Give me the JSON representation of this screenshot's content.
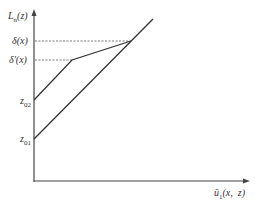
{
  "diagram": {
    "y_axis_label": "L",
    "y_axis_label_sub": "n",
    "y_axis_label_arg": "(z)",
    "x_axis_label_base": "ū",
    "x_axis_label_sub": "1",
    "x_axis_label_arg": "(x,  z)",
    "ticks": [
      {
        "id": "delta",
        "label": "δ(x)"
      },
      {
        "id": "delta_prime",
        "label": "δ′(x)"
      },
      {
        "id": "z02",
        "label": "z",
        "sub": "02"
      },
      {
        "id": "z01",
        "label": "z",
        "sub": "01"
      }
    ],
    "lines": [
      {
        "name": "lower-line",
        "from": "z01",
        "description": "straight line from z01 rising through intersection point"
      },
      {
        "name": "upper-line",
        "from": "z02",
        "description": "line from z02 to kink at δ′(x), then shallower slope to intersection at δ(x)"
      }
    ],
    "colors": {
      "line": "#333333",
      "dashed": "#555555"
    }
  }
}
